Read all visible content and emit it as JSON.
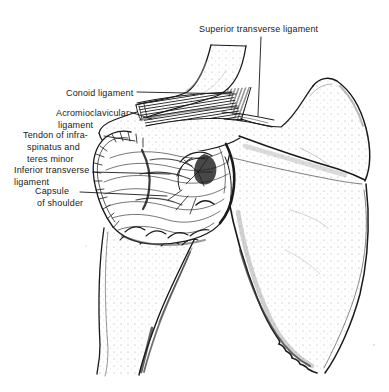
{
  "figure": {
    "background_color": "#ffffff",
    "ink_color": "#1a1a1a"
  },
  "labels": {
    "superior_transverse_ligament": {
      "text": "Superior transverse ligament"
    },
    "conoid_ligament": {
      "text": "Conoid ligament"
    },
    "acromioclavicular_ligament": {
      "line1": "Acromioclavicular",
      "line2": "ligament"
    },
    "tendon_of_infraspinatus_and_teres_minor": {
      "line1": "Tendon of infra-",
      "line2": "spinatus and",
      "line3": "teres minor"
    },
    "inferior_transverse_ligament": {
      "line1": "Inferior transverse",
      "line2": "ligament"
    },
    "capsule_of_shoulder": {
      "line1": "Capsule",
      "line2": "of shoulder"
    }
  }
}
